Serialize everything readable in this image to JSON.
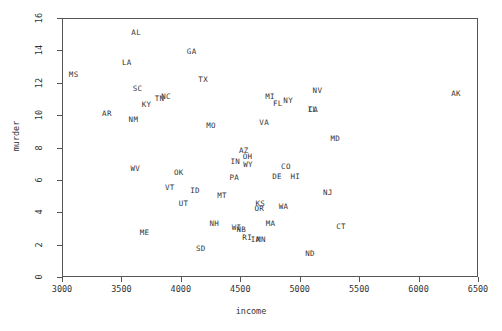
{
  "chart_data": {
    "type": "scatter",
    "title": "",
    "xlabel": "income",
    "ylabel": "murder",
    "xlim": [
      3000,
      6500
    ],
    "ylim": [
      0,
      16
    ],
    "xticks": [
      3000,
      3500,
      4000,
      4500,
      5000,
      5500,
      6000,
      6500
    ],
    "yticks": [
      0,
      2,
      4,
      6,
      8,
      10,
      12,
      14,
      16
    ],
    "grid": false,
    "legend": null,
    "marker_style": "text-label",
    "points": [
      {
        "label": "AL",
        "x": 3624,
        "y": 15.1
      },
      {
        "label": "AK",
        "x": 6315,
        "y": 11.3
      },
      {
        "label": "AZ",
        "x": 4530,
        "y": 7.8
      },
      {
        "label": "AR",
        "x": 3378,
        "y": 10.1
      },
      {
        "label": "CA",
        "x": 5114,
        "y": 10.3
      },
      {
        "label": "CO",
        "x": 4884,
        "y": 6.8
      },
      {
        "label": "CT",
        "x": 5348,
        "y": 3.1
      },
      {
        "label": "DE",
        "x": 4809,
        "y": 6.2
      },
      {
        "label": "FL",
        "x": 4815,
        "y": 10.7
      },
      {
        "label": "GA",
        "x": 4091,
        "y": 13.9
      },
      {
        "label": "HI",
        "x": 4963,
        "y": 6.2
      },
      {
        "label": "ID",
        "x": 4119,
        "y": 5.3
      },
      {
        "label": "IL",
        "x": 5107,
        "y": 10.3
      },
      {
        "label": "IN",
        "x": 4458,
        "y": 7.1
      },
      {
        "label": "IA",
        "x": 4628,
        "y": 2.3
      },
      {
        "label": "KS",
        "x": 4669,
        "y": 4.5
      },
      {
        "label": "KY",
        "x": 3712,
        "y": 10.6
      },
      {
        "label": "LA",
        "x": 3545,
        "y": 13.2
      },
      {
        "label": "ME",
        "x": 3694,
        "y": 2.7
      },
      {
        "label": "MD",
        "x": 5299,
        "y": 8.5
      },
      {
        "label": "MA",
        "x": 4755,
        "y": 3.3
      },
      {
        "label": "MI",
        "x": 4751,
        "y": 11.1
      },
      {
        "label": "MN",
        "x": 4675,
        "y": 2.3
      },
      {
        "label": "MS",
        "x": 3098,
        "y": 12.5
      },
      {
        "label": "MO",
        "x": 4254,
        "y": 9.3
      },
      {
        "label": "MT",
        "x": 4347,
        "y": 5.0
      },
      {
        "label": "NB",
        "x": 4508,
        "y": 2.9
      },
      {
        "label": "NV",
        "x": 5149,
        "y": 11.5
      },
      {
        "label": "NH",
        "x": 4281,
        "y": 3.3
      },
      {
        "label": "NJ",
        "x": 5237,
        "y": 5.2
      },
      {
        "label": "NM",
        "x": 3601,
        "y": 9.7
      },
      {
        "label": "NY",
        "x": 4903,
        "y": 10.9
      },
      {
        "label": "NC",
        "x": 3875,
        "y": 11.1
      },
      {
        "label": "ND",
        "x": 5087,
        "y": 1.4
      },
      {
        "label": "OH",
        "x": 4561,
        "y": 7.4
      },
      {
        "label": "OK",
        "x": 3983,
        "y": 6.4
      },
      {
        "label": "OR",
        "x": 4660,
        "y": 4.2
      },
      {
        "label": "PA",
        "x": 4449,
        "y": 6.1
      },
      {
        "label": "RI",
        "x": 4558,
        "y": 2.4
      },
      {
        "label": "SC",
        "x": 3635,
        "y": 11.6
      },
      {
        "label": "SD",
        "x": 4167,
        "y": 1.7
      },
      {
        "label": "TN",
        "x": 3821,
        "y": 11.0
      },
      {
        "label": "TX",
        "x": 4188,
        "y": 12.2
      },
      {
        "label": "UT",
        "x": 4022,
        "y": 4.5
      },
      {
        "label": "VT",
        "x": 3907,
        "y": 5.5
      },
      {
        "label": "VA",
        "x": 4701,
        "y": 9.5
      },
      {
        "label": "WA",
        "x": 4864,
        "y": 4.3
      },
      {
        "label": "WV",
        "x": 3617,
        "y": 6.7
      },
      {
        "label": "WI",
        "x": 4468,
        "y": 3.0
      },
      {
        "label": "WY",
        "x": 4566,
        "y": 6.9
      }
    ]
  },
  "axes": {
    "x": {
      "label": "income",
      "tick_labels": [
        "3000",
        "3500",
        "4000",
        "4500",
        "5000",
        "5500",
        "6000",
        "6500"
      ]
    },
    "y": {
      "label": "murder",
      "tick_labels": [
        "0",
        "2",
        "4",
        "6",
        "8",
        "10",
        "12",
        "14",
        "16"
      ]
    }
  },
  "colors": {
    "background": "#ffffff",
    "frame": "#555555",
    "text": "#333333"
  }
}
